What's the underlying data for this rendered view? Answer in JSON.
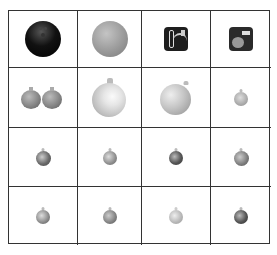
{
  "grid": {
    "rows": 4,
    "cols": 4,
    "cells": [
      {
        "row": 0,
        "col": 0,
        "item": "bowling-ball",
        "color": "#111111"
      },
      {
        "row": 0,
        "col": 1,
        "item": "grey-ball",
        "color": "#9a9a9a"
      },
      {
        "row": 0,
        "col": 2,
        "item": "app-icon-dark-chain",
        "color": "#222222"
      },
      {
        "row": 0,
        "col": 3,
        "item": "app-icon-dark-face",
        "color": "#2a2a2a"
      },
      {
        "row": 1,
        "col": 0,
        "item": "pair-of-ornaments",
        "color": "#8a8a8a"
      },
      {
        "row": 1,
        "col": 1,
        "item": "large-white-ornament",
        "color": "#d8d8d8"
      },
      {
        "row": 1,
        "col": 2,
        "item": "large-ornament-light",
        "color": "#b8b8b8"
      },
      {
        "row": 1,
        "col": 3,
        "item": "small-ornament",
        "color": "#aaaaaa"
      },
      {
        "row": 2,
        "col": 0,
        "item": "small-ornament",
        "color": "#6a6a6a"
      },
      {
        "row": 2,
        "col": 1,
        "item": "small-ornament",
        "color": "#8c8c8c"
      },
      {
        "row": 2,
        "col": 2,
        "item": "small-ornament",
        "color": "#555555"
      },
      {
        "row": 2,
        "col": 3,
        "item": "small-ornament",
        "color": "#7a7a7a"
      },
      {
        "row": 3,
        "col": 0,
        "item": "small-ornament",
        "color": "#888888"
      },
      {
        "row": 3,
        "col": 1,
        "item": "small-ornament",
        "color": "#808080"
      },
      {
        "row": 3,
        "col": 2,
        "item": "small-ornament",
        "color": "#b5b5b5"
      },
      {
        "row": 3,
        "col": 3,
        "item": "small-ornament",
        "color": "#555555"
      }
    ]
  },
  "colors": {
    "grid_line": "#333333",
    "background": "#ffffff"
  }
}
